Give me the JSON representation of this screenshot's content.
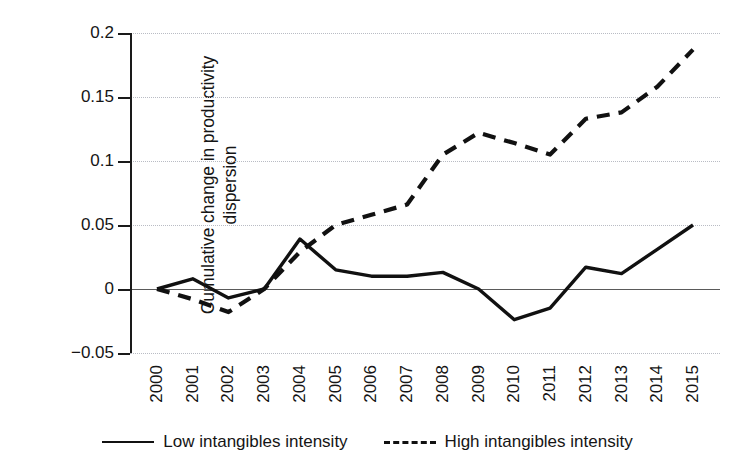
{
  "chart_data": {
    "type": "line",
    "title": "",
    "xlabel": "",
    "ylabel": "Cumulative change in productivity dispersion",
    "ylabel_line1": "Cumulative change in productivity",
    "ylabel_line2": "dispersion",
    "x": [
      2000,
      2001,
      2002,
      2003,
      2004,
      2005,
      2006,
      2007,
      2008,
      2009,
      2010,
      2011,
      2012,
      2013,
      2014,
      2015
    ],
    "xtick_labels": [
      "2000",
      "2001",
      "2002",
      "2003",
      "2004",
      "2005",
      "2006",
      "2007",
      "2008",
      "2009",
      "2010",
      "2011",
      "2012",
      "2013",
      "2014",
      "2015"
    ],
    "ytick_labels": [
      "0.2",
      "0.15",
      "0.1",
      "0.05",
      "0",
      "-0.05"
    ],
    "ytick_values": [
      0.2,
      0.15,
      0.1,
      0.05,
      0,
      -0.05
    ],
    "ylim": [
      -0.05,
      0.2
    ],
    "xlim": [
      2000,
      2015
    ],
    "grid": true,
    "grid_style": "dotted-horizontal",
    "zero_line": true,
    "legend_position": "bottom-center",
    "series": [
      {
        "name": "Low intangibles intensity",
        "style": "solid",
        "color": "#111111",
        "values": [
          0.0,
          0.008,
          -0.007,
          0.0,
          0.039,
          0.015,
          0.01,
          0.01,
          0.013,
          0.0,
          -0.024,
          -0.015,
          0.017,
          0.012,
          0.031,
          0.05
        ]
      },
      {
        "name": "High intangibles intensity",
        "style": "dashed",
        "color": "#111111",
        "values": [
          0.0,
          -0.008,
          -0.018,
          0.0,
          0.029,
          0.05,
          0.058,
          0.066,
          0.105,
          0.122,
          0.114,
          0.105,
          0.133,
          0.138,
          0.158,
          0.187
        ]
      }
    ]
  },
  "legend": {
    "items": [
      {
        "label": "Low intangibles intensity",
        "style": "solid"
      },
      {
        "label": "High intangibles intensity",
        "style": "dashed"
      }
    ]
  },
  "colors": {
    "series": "#111111",
    "gridline": "#b9bcc4",
    "zero_line": "#5a5a5a",
    "text": "#151515",
    "background": "#ffffff"
  }
}
